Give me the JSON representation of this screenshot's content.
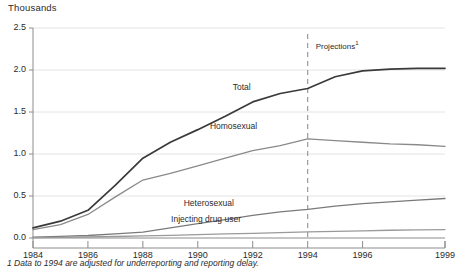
{
  "units_label": "Thousands",
  "projections_label": "Projections",
  "projections_superscript": "1",
  "footnote": "1 Data to 1994 are adjusted for underreporting and reporting delay.",
  "axis": {
    "y_ticks": [
      "0.0",
      "0.5",
      "1.0",
      "1.5",
      "2.0",
      "2.5"
    ],
    "x_ticks": [
      "1984",
      "1986",
      "1988",
      "1990",
      "1992",
      "1994",
      "1996",
      "1999"
    ]
  },
  "series_labels": {
    "total": "Total",
    "homosexual": "Homosexual",
    "heterosexual": "Heterosexual",
    "injecting": "Injecting drug user"
  },
  "colors": {
    "total": "#3a3a3a",
    "homosexual": "#8a8a8a",
    "heterosexual": "#7a7a7a",
    "injecting": "#9a9a9a",
    "gridline": "#e4e4e4",
    "axis": "#8c8c8c",
    "projection_divider": "#9a9a9a",
    "text": "#2b2b2b"
  },
  "chart_data": {
    "type": "line",
    "title": "",
    "subtitle": "",
    "xlabel": "",
    "ylabel": "Thousands",
    "xlim": [
      1984,
      1999
    ],
    "ylim": [
      0.0,
      2.5
    ],
    "grid": true,
    "legend": "inline-labels",
    "x": [
      1984,
      1985,
      1986,
      1987,
      1988,
      1989,
      1990,
      1991,
      1992,
      1993,
      1994,
      1995,
      1996,
      1997,
      1998,
      1999
    ],
    "projection_start_year": 1994,
    "annotations": [
      {
        "text": "Projections1",
        "x": 1994.2,
        "y": 2.25
      },
      {
        "text": "Total",
        "x": 1991.6,
        "y": 1.78
      },
      {
        "text": "Homosexual",
        "x": 1991.3,
        "y": 1.32
      },
      {
        "text": "Heterosexual",
        "x": 1990.4,
        "y": 0.4
      },
      {
        "text": "Injecting drug user",
        "x": 1990.3,
        "y": 0.21
      }
    ],
    "series": [
      {
        "name": "Total",
        "values": [
          0.12,
          0.2,
          0.33,
          0.63,
          0.95,
          1.14,
          1.29,
          1.45,
          1.62,
          1.72,
          1.78,
          1.92,
          1.99,
          2.01,
          2.02,
          2.02
        ]
      },
      {
        "name": "Homosexual",
        "values": [
          0.1,
          0.16,
          0.28,
          0.49,
          0.69,
          0.77,
          0.86,
          0.95,
          1.04,
          1.1,
          1.18,
          1.16,
          1.14,
          1.12,
          1.11,
          1.09
        ]
      },
      {
        "name": "Heterosexual",
        "values": [
          0.01,
          0.02,
          0.03,
          0.05,
          0.07,
          0.12,
          0.17,
          0.22,
          0.27,
          0.31,
          0.34,
          0.38,
          0.41,
          0.43,
          0.45,
          0.47
        ]
      },
      {
        "name": "Injecting drug user",
        "values": [
          0.005,
          0.008,
          0.012,
          0.018,
          0.025,
          0.032,
          0.04,
          0.048,
          0.056,
          0.064,
          0.072,
          0.08,
          0.086,
          0.092,
          0.097,
          0.1
        ]
      }
    ]
  }
}
